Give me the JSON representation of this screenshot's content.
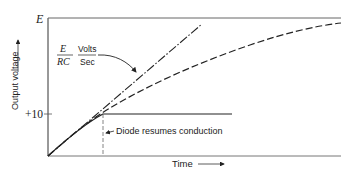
{
  "diagram": {
    "y_axis_label": "Output voltage",
    "x_axis_label": "Time",
    "y_level_top": "E",
    "y_level_clamp": "+10",
    "slope_label": {
      "numerator": "E",
      "denominator": "RC",
      "unit_numerator": "Volts",
      "unit_denominator": "Sec"
    },
    "annotation": "Diode resumes conduction",
    "curves": [
      {
        "name": "linear-ramp",
        "style": "dash-dot",
        "description": "Initial slope E/RC"
      },
      {
        "name": "exponential-charge",
        "style": "dashed",
        "description": "RC charging curve approaching E"
      },
      {
        "name": "clamped-output",
        "style": "solid",
        "description": "Output clamped at +10"
      }
    ],
    "colors": {
      "line": "#222222",
      "background": "#ffffff"
    }
  }
}
